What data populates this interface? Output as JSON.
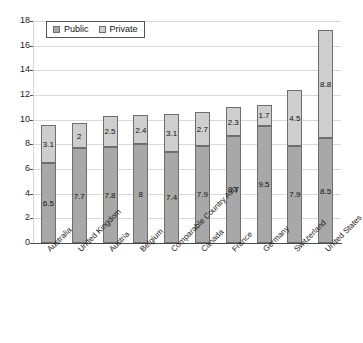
{
  "chart_data": {
    "type": "bar",
    "stacked": true,
    "title": "",
    "subtitle": "",
    "xlabel": "",
    "ylabel": "",
    "ylim": [
      0,
      18
    ],
    "ytick_step": 2,
    "yticks": [
      "18",
      "16",
      "14",
      "12",
      "10",
      "8",
      "6",
      "4",
      "2",
      "0"
    ],
    "grid": true,
    "legend_position": "top-left",
    "categories": [
      "Australia",
      "United Kingdom",
      "Austria",
      "Belgium",
      "Comparable Country Avg.",
      "Canada",
      "France",
      "Germany",
      "Switzerland",
      "United States"
    ],
    "series": [
      {
        "name": "Public",
        "color": "#a8a8a8",
        "values": [
          6.5,
          7.7,
          7.8,
          8,
          7.4,
          7.9,
          8.7,
          9.5,
          7.9,
          8.5
        ],
        "labels": [
          "6.5",
          "7.7",
          "7.8",
          "8",
          "7.4",
          "7.9",
          "8.7",
          "9.5",
          "7.9",
          "8.5"
        ]
      },
      {
        "name": "Private",
        "color": "#cecece",
        "values": [
          3.1,
          2,
          2.5,
          2.4,
          3.1,
          2.7,
          2.3,
          1.7,
          4.5,
          8.8
        ],
        "labels": [
          "3.1",
          "2",
          "2.5",
          "2.4",
          "3.1",
          "2.7",
          "2.3",
          "1.7",
          "4.5",
          "8.8"
        ]
      }
    ],
    "totals": [
      9.6,
      9.7,
      10.3,
      10.4,
      10.5,
      10.6,
      11,
      11.2,
      12.4,
      17.3
    ]
  },
  "legend": {
    "items": [
      {
        "label": "Public",
        "swatch": "public-swatch-icon"
      },
      {
        "label": "Private",
        "swatch": "private-swatch-icon"
      }
    ]
  }
}
